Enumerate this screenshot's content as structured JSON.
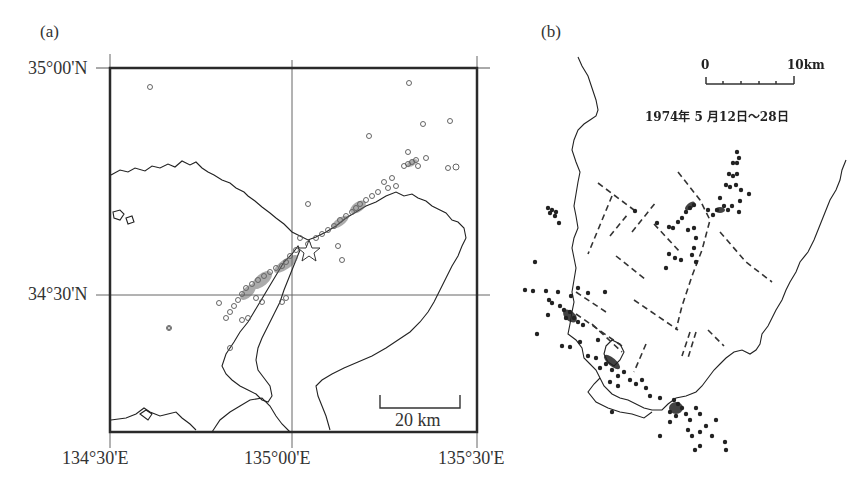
{
  "figure": {
    "panel_a": {
      "label": "(a)",
      "lat_labels": [
        "35°00'N",
        "34°30'N"
      ],
      "lon_labels": [
        "134°30'E",
        "135°00'E",
        "135°30'E"
      ],
      "scale_bar": "20 km",
      "marker_style": "open-circle",
      "epicenter_marker": "star"
    },
    "panel_b": {
      "label": "(b)",
      "scale_start": "0",
      "scale_end": "10km",
      "date_range": "1974年 5 月12日～28日",
      "marker_style": "filled-circle",
      "fault_style": "dashed-line"
    }
  },
  "colors": {
    "ink": "#333333",
    "frame": "#2a2a2a",
    "grid": "#666666",
    "background": "#ffffff"
  }
}
